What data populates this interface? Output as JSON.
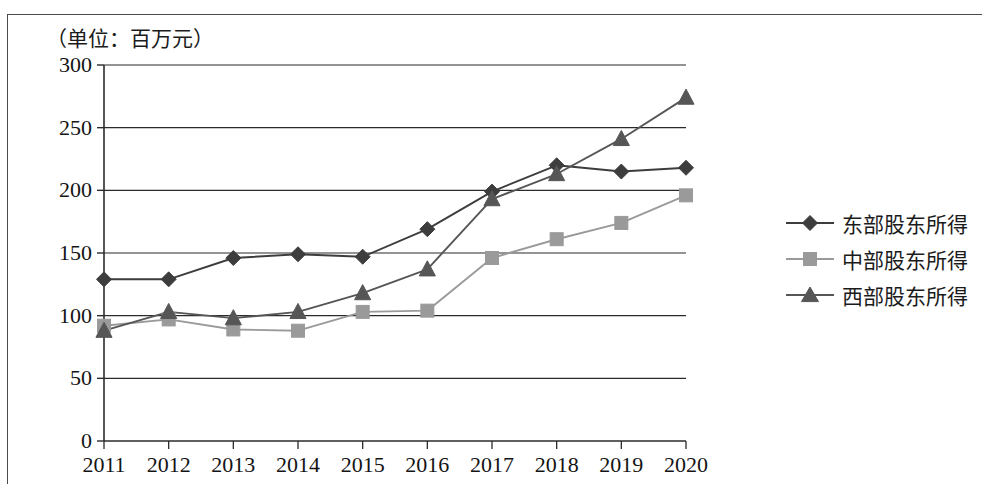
{
  "caption": "（单位：百万元）",
  "chart_data": {
    "type": "line",
    "title": "",
    "subtitle": "",
    "unit_note": "（单位：百万元）",
    "xlabel": "",
    "ylabel": "",
    "categories": [
      "2011",
      "2012",
      "2013",
      "2014",
      "2015",
      "2016",
      "2017",
      "2018",
      "2019",
      "2020"
    ],
    "ylim": [
      0,
      300
    ],
    "ytick_labels": [
      "0",
      "50",
      "100",
      "150",
      "200",
      "250",
      "300"
    ],
    "ytick_values": [
      0,
      50,
      100,
      150,
      200,
      250,
      300
    ],
    "grid": "horizontal",
    "legend_position": "right",
    "series": [
      {
        "name": "东部股东所得",
        "marker": "diamond",
        "color": "#3d3d3d",
        "values": [
          129,
          129,
          146,
          149,
          147,
          169,
          199,
          220,
          215,
          218
        ]
      },
      {
        "name": "中部股东所得",
        "marker": "square",
        "color": "#9a9a9a",
        "values": [
          92,
          97,
          89,
          88,
          103,
          104,
          146,
          161,
          174,
          196
        ]
      },
      {
        "name": "西部股东所得",
        "marker": "triangle",
        "color": "#565656",
        "values": [
          88,
          103,
          98,
          103,
          118,
          137,
          193,
          213,
          241,
          274
        ]
      }
    ]
  },
  "legend": {
    "items": [
      {
        "label": "东部股东所得",
        "marker": "diamond",
        "color": "#3d3d3d"
      },
      {
        "label": "中部股东所得",
        "marker": "square",
        "color": "#9a9a9a"
      },
      {
        "label": "西部股东所得",
        "marker": "triangle",
        "color": "#565656"
      }
    ]
  }
}
